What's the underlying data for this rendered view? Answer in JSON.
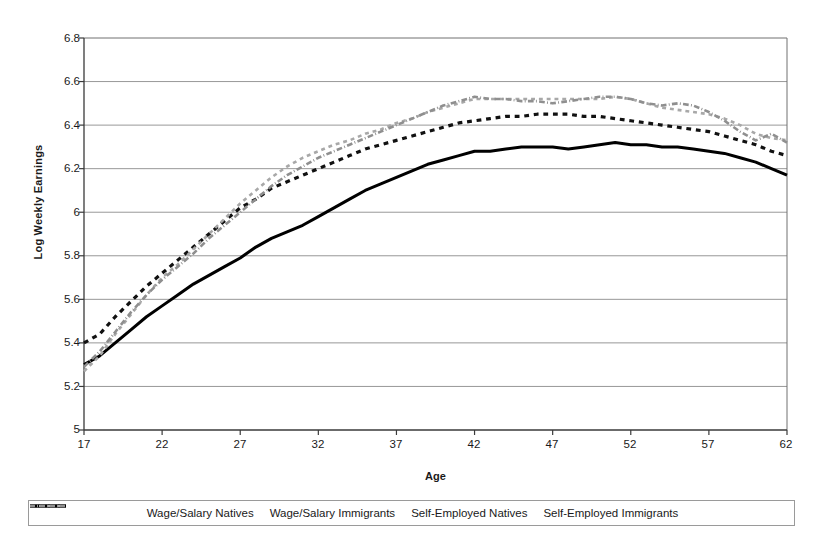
{
  "chart_data": {
    "type": "line",
    "title": "",
    "xlabel": "Age",
    "ylabel": "Log Weekly Earnings",
    "xlim": [
      17,
      62
    ],
    "ylim": [
      5,
      6.8
    ],
    "xticks": [
      "17",
      "22",
      "27",
      "32",
      "37",
      "42",
      "47",
      "52",
      "57",
      "62"
    ],
    "yticks": [
      "6.8",
      "6.6",
      "6.4",
      "6.2",
      "6",
      "5.8",
      "5.6",
      "5.4",
      "5.2",
      "5"
    ],
    "grid": "horizontal",
    "legend_position": "bottom",
    "x": [
      17,
      18,
      19,
      20,
      21,
      22,
      23,
      24,
      25,
      26,
      27,
      28,
      29,
      30,
      31,
      32,
      33,
      34,
      35,
      36,
      37,
      38,
      39,
      40,
      41,
      42,
      43,
      44,
      45,
      46,
      47,
      48,
      49,
      50,
      51,
      52,
      53,
      54,
      55,
      56,
      57,
      58,
      59,
      60,
      61,
      62
    ],
    "series": [
      {
        "name": "Wage/Salary Natives",
        "style": "dashed",
        "color": "#111111",
        "width": 3.2,
        "values": [
          5.4,
          5.44,
          5.52,
          5.59,
          5.66,
          5.72,
          5.78,
          5.84,
          5.9,
          5.96,
          6.02,
          6.06,
          6.11,
          6.14,
          6.17,
          6.2,
          6.23,
          6.26,
          6.29,
          6.31,
          6.33,
          6.35,
          6.37,
          6.39,
          6.41,
          6.42,
          6.43,
          6.44,
          6.44,
          6.45,
          6.45,
          6.45,
          6.44,
          6.44,
          6.43,
          6.42,
          6.41,
          6.4,
          6.39,
          6.38,
          6.37,
          6.35,
          6.33,
          6.31,
          6.28,
          6.26
        ]
      },
      {
        "name": "Wage/Salary Immigrants",
        "style": "solid",
        "color": "#000000",
        "width": 3.0,
        "values": [
          5.3,
          5.34,
          5.4,
          5.46,
          5.52,
          5.57,
          5.62,
          5.67,
          5.71,
          5.75,
          5.79,
          5.84,
          5.88,
          5.91,
          5.94,
          5.98,
          6.02,
          6.06,
          6.1,
          6.13,
          6.16,
          6.19,
          6.22,
          6.24,
          6.26,
          6.28,
          6.28,
          6.29,
          6.3,
          6.3,
          6.3,
          6.29,
          6.3,
          6.31,
          6.32,
          6.31,
          6.31,
          6.3,
          6.3,
          6.29,
          6.28,
          6.27,
          6.25,
          6.23,
          6.2,
          6.17
        ]
      },
      {
        "name": "Self-Employed Natives",
        "style": "dashed",
        "color": "#a8a8a8",
        "width": 2.6,
        "values": [
          5.27,
          5.34,
          5.44,
          5.53,
          5.62,
          5.7,
          5.76,
          5.83,
          5.9,
          5.97,
          6.04,
          6.1,
          6.16,
          6.21,
          6.25,
          6.28,
          6.31,
          6.33,
          6.36,
          6.38,
          6.41,
          6.43,
          6.46,
          6.48,
          6.5,
          6.52,
          6.52,
          6.52,
          6.52,
          6.52,
          6.52,
          6.52,
          6.52,
          6.52,
          6.53,
          6.52,
          6.5,
          6.48,
          6.47,
          6.46,
          6.45,
          6.43,
          6.4,
          6.36,
          6.34,
          6.33
        ]
      },
      {
        "name": "Self-Employed Immigrants",
        "style": "dash-dot",
        "color": "#8f8f8f",
        "width": 2.6,
        "values": [
          5.29,
          5.36,
          5.45,
          5.54,
          5.62,
          5.69,
          5.75,
          5.81,
          5.88,
          5.94,
          6.0,
          6.06,
          6.12,
          6.17,
          6.21,
          6.25,
          6.28,
          6.31,
          6.34,
          6.37,
          6.4,
          6.43,
          6.46,
          6.49,
          6.51,
          6.53,
          6.52,
          6.52,
          6.51,
          6.51,
          6.5,
          6.51,
          6.52,
          6.53,
          6.53,
          6.52,
          6.5,
          6.49,
          6.5,
          6.49,
          6.46,
          6.42,
          6.37,
          6.33,
          6.36,
          6.32
        ]
      }
    ]
  },
  "axes": {
    "y_label": "Log Weekly Earnings",
    "x_label": "Age",
    "y_ticks": [
      "6.8",
      "6.6",
      "6.4",
      "6.2",
      "6",
      "5.8",
      "5.6",
      "5.4",
      "5.2",
      "5"
    ],
    "x_ticks": [
      "17",
      "22",
      "27",
      "32",
      "37",
      "42",
      "47",
      "52",
      "57",
      "62"
    ]
  },
  "legend": {
    "items": [
      {
        "label": "Wage/Salary Natives",
        "icon": "dashed-line-icon"
      },
      {
        "label": "Wage/Salary Immigrants",
        "icon": "solid-line-icon"
      },
      {
        "label": "Self-Employed Natives",
        "icon": "light-dashed-line-icon"
      },
      {
        "label": "Self-Employed Immigrants",
        "icon": "dash-dot-line-icon"
      }
    ]
  }
}
